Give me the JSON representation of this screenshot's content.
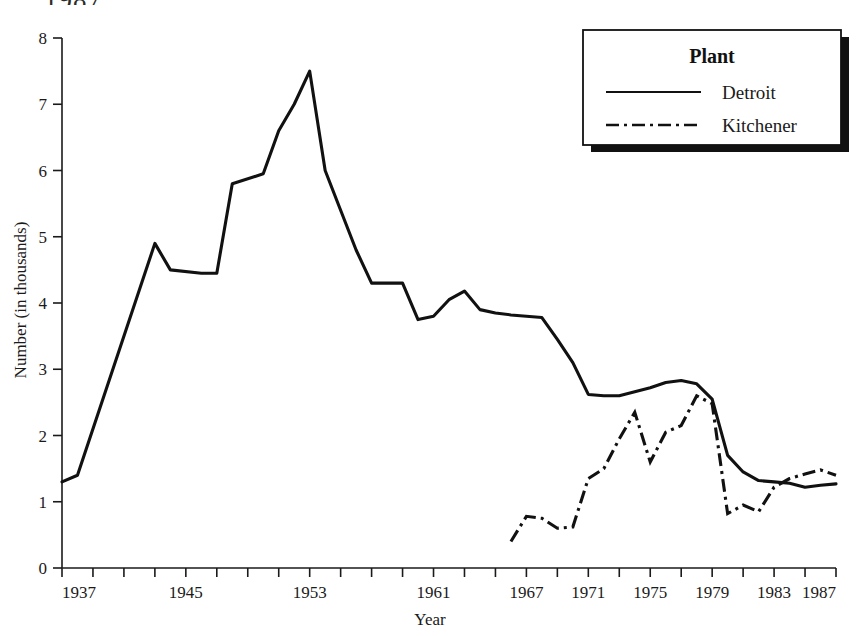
{
  "page": {
    "cutoff_header_text": "1987"
  },
  "chart_data": {
    "type": "line",
    "title": "",
    "xlabel": "Year",
    "ylabel": "Number (in thousands)",
    "xlim": [
      1937,
      1987
    ],
    "ylim": [
      0,
      8
    ],
    "grid": false,
    "x_tick_labels": [
      "1937",
      "1945",
      "1953",
      "1961",
      "1967",
      "1971",
      "1975",
      "1979",
      "1983",
      "1987"
    ],
    "x_tick_values": [
      1937,
      1945,
      1953,
      1961,
      1967,
      1971,
      1975,
      1979,
      1983,
      1987
    ],
    "x_minor_tick_interval": 2,
    "y_tick_labels": [
      "0",
      "1",
      "2",
      "3",
      "4",
      "5",
      "6",
      "7",
      "8"
    ],
    "y_tick_values": [
      0,
      1,
      2,
      3,
      4,
      5,
      6,
      7,
      8
    ],
    "legend": {
      "position": "top-right",
      "title": "Plant",
      "entries": [
        {
          "name": "Detroit",
          "style": "solid"
        },
        {
          "name": "Kitchener",
          "style": "dash-dot"
        }
      ]
    },
    "series": [
      {
        "name": "Detroit",
        "style": "solid",
        "x": [
          1937,
          1938,
          1943,
          1944,
          1946,
          1947,
          1948,
          1950,
          1951,
          1952,
          1953,
          1954,
          1955,
          1956,
          1957,
          1958,
          1959,
          1960,
          1961,
          1962,
          1963,
          1964,
          1965,
          1966,
          1967,
          1968,
          1969,
          1970,
          1971,
          1972,
          1973,
          1974,
          1975,
          1976,
          1977,
          1978,
          1979,
          1980,
          1981,
          1982,
          1983,
          1984,
          1985,
          1986,
          1987
        ],
        "values": [
          1.3,
          1.4,
          4.9,
          4.5,
          4.45,
          4.45,
          5.8,
          5.95,
          6.6,
          7.0,
          7.5,
          6.0,
          5.4,
          4.8,
          4.3,
          4.3,
          4.3,
          3.75,
          3.8,
          4.05,
          4.18,
          3.9,
          3.85,
          3.82,
          3.8,
          3.78,
          3.45,
          3.1,
          2.62,
          2.6,
          2.6,
          2.66,
          2.72,
          2.8,
          2.83,
          2.78,
          2.55,
          1.7,
          1.45,
          1.32,
          1.3,
          1.28,
          1.22,
          1.25,
          1.27
        ]
      },
      {
        "name": "Kitchener",
        "style": "dash-dot",
        "x": [
          1966,
          1967,
          1968,
          1969,
          1970,
          1971,
          1972,
          1973,
          1974,
          1975,
          1976,
          1977,
          1978,
          1979,
          1980,
          1981,
          1982,
          1983,
          1984,
          1985,
          1986,
          1987
        ],
        "values": [
          0.4,
          0.78,
          0.75,
          0.6,
          0.62,
          1.35,
          1.5,
          1.95,
          2.35,
          1.6,
          2.05,
          2.15,
          2.6,
          2.48,
          0.82,
          0.95,
          0.85,
          1.22,
          1.35,
          1.42,
          1.48,
          1.4
        ]
      }
    ]
  }
}
